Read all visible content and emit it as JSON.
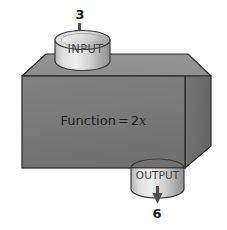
{
  "diagram": {
    "background_color": "#ffffff",
    "box": {
      "name": "function-box",
      "front_color": "#7b7b7b",
      "top_color": "#8d8d8d",
      "side_color": "#6d6d6d",
      "outline_color": "#2b2b2b",
      "label": "Function = 2x",
      "label_prefix": "Function",
      "label_operator": "=",
      "label_coefficient": "2",
      "label_variable": "x"
    },
    "input": {
      "name": "input-cylinder",
      "label": "INPUT",
      "value": "3",
      "body_color": "#c9c9c9",
      "top_color": "#dcdcdc",
      "outline_color": "#3a3a3a",
      "arrow_color": "#4d4d4d",
      "arrow_direction": "down"
    },
    "output": {
      "name": "output-cylinder",
      "label": "OUTPUT",
      "value": "6",
      "body_color": "#c9c9c9",
      "top_color": "#dcdcdc",
      "outline_color": "#3a3a3a",
      "arrow_color": "#4d4d4d",
      "arrow_direction": "down"
    }
  }
}
